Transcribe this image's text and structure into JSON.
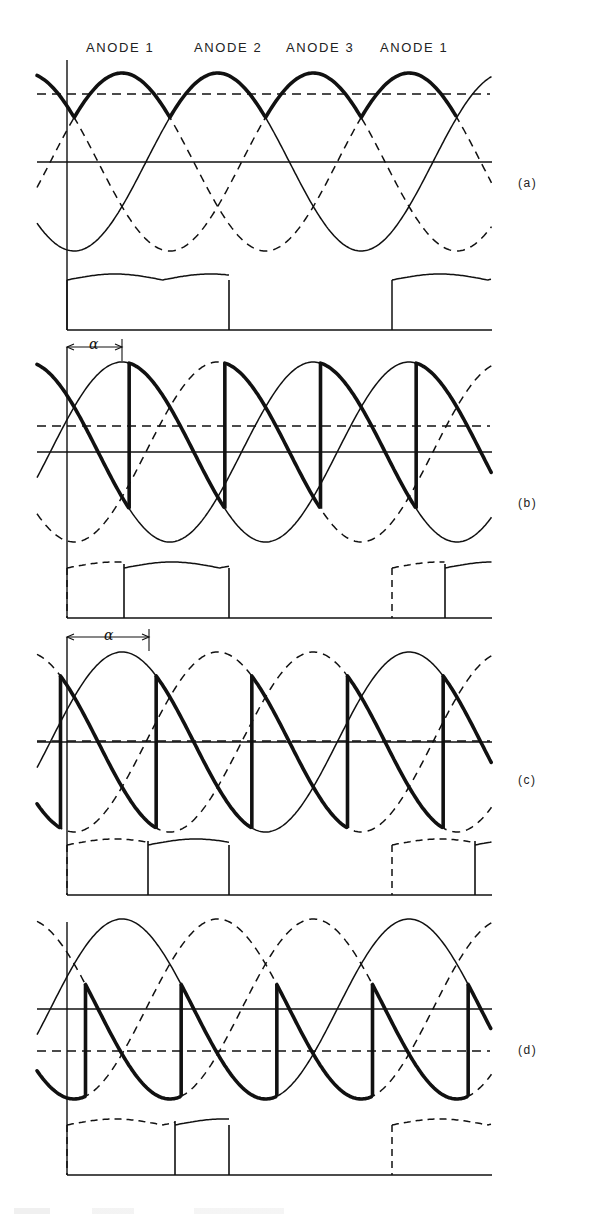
{
  "figure": {
    "anode_labels": [
      "ANODE 1",
      "ANODE 2",
      "ANODE 3",
      "ANODE 1"
    ],
    "panel_labels": [
      "(a)",
      "(b)",
      "(c)",
      "(d)"
    ],
    "alpha_symbol": "α",
    "colors": {
      "ink": "#111111",
      "background": "#ffffff"
    }
  },
  "panels": [
    {
      "id": "a",
      "label": "(a)",
      "firing_delay": "α = 0",
      "dc_level": "high, above zero",
      "current": "continuous block of three humps, then gap, then restart"
    },
    {
      "id": "b",
      "label": "(b)",
      "firing_delay": "α shown (small)",
      "dc_level": "slightly above zero",
      "current": "dashed hump then solid humps"
    },
    {
      "id": "c",
      "label": "(c)",
      "firing_delay": "α shown (larger)",
      "dc_level": "near zero",
      "current": "dashed humps then solid hump"
    },
    {
      "id": "d",
      "label": "(d)",
      "firing_delay": "α beyond 90°",
      "dc_level": "below zero (negative)",
      "current": "dashed humps then short solid hump"
    }
  ]
}
